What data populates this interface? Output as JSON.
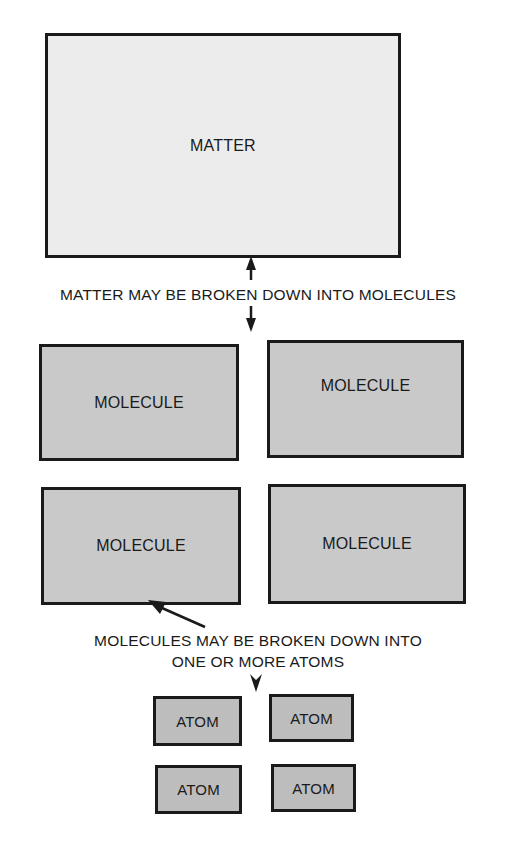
{
  "diagram": {
    "colors": {
      "outline": "#1a1a1a",
      "matter_fill": "#ececec",
      "molecule_fill": "#c9c9c9",
      "atom_fill": "#bdbdbd",
      "background": "#ffffff"
    },
    "matter": {
      "label": "MATTER"
    },
    "caption_matter": "MATTER MAY BE BROKEN DOWN INTO MOLECULES",
    "molecules": [
      {
        "label": "MOLECULE"
      },
      {
        "label": "MOLECULE"
      },
      {
        "label": "MOLECULE"
      },
      {
        "label": "MOLECULE"
      }
    ],
    "caption_molecules": {
      "line1": "MOLECULES MAY BE BROKEN DOWN INTO",
      "line2": "ONE OR MORE ATOMS"
    },
    "atoms": [
      {
        "label": "ATOM"
      },
      {
        "label": "ATOM"
      },
      {
        "label": "ATOM"
      },
      {
        "label": "ATOM"
      }
    ],
    "edges": [
      {
        "from": "caption_matter",
        "to": "matter",
        "type": "arrow-up"
      },
      {
        "from": "caption_matter",
        "to": "molecules",
        "type": "arrow-down"
      },
      {
        "from": "caption_molecules",
        "to": "molecule-3",
        "type": "arrow-diagonal"
      },
      {
        "from": "caption_molecules",
        "to": "atoms",
        "type": "arrow-down"
      }
    ]
  }
}
